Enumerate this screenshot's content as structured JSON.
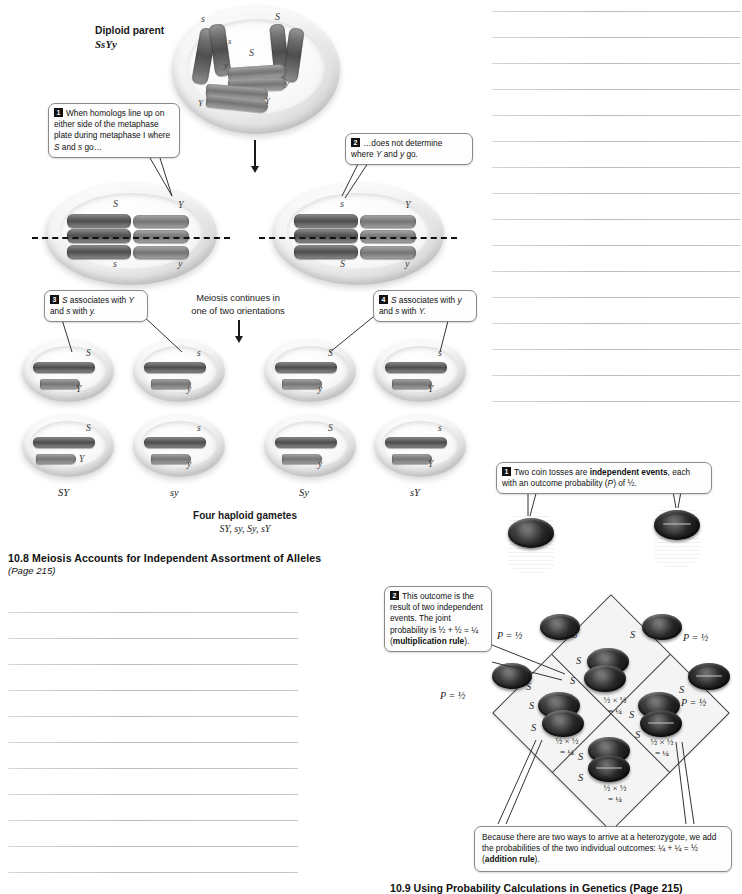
{
  "figure_top": {
    "parent_label_line1": "Diploid parent",
    "parent_label_line2": "SsYy",
    "callouts": [
      {
        "num": "1",
        "text": "When homologs line up on either side of the metaphase plate during metaphase I where S and s go…"
      },
      {
        "num": "2",
        "text": "…does not determine where Y and y go."
      },
      {
        "num": "3",
        "text": "S associates with Y and s with y."
      },
      {
        "num": "4",
        "text": "S associates with y and s with Y."
      }
    ],
    "middle_note_line1": "Meiosis continues in",
    "middle_note_line2": "one of two orientations",
    "metaphase_left": {
      "top_left": "S",
      "top_right": "Y",
      "bottom_left": "s",
      "bottom_right": "y"
    },
    "metaphase_right": {
      "top_left": "s",
      "top_right": "Y",
      "bottom_left": "S",
      "bottom_right": "y"
    },
    "parent_chromosome_labels": [
      "s",
      "S",
      "s",
      "S",
      "y",
      "y",
      "Y",
      "Y"
    ],
    "gamete_labels": [
      "SY",
      "sy",
      "Sy",
      "sY"
    ],
    "gamete_cell_labels": [
      {
        "top": "S",
        "bottom": "Y"
      },
      {
        "top": "s",
        "bottom": "y"
      },
      {
        "top": "S",
        "bottom": "y"
      },
      {
        "top": "s",
        "bottom": "Y"
      },
      {
        "top": "S",
        "bottom": "Y"
      },
      {
        "top": "s",
        "bottom": "y"
      },
      {
        "top": "S",
        "bottom": "y"
      },
      {
        "top": "s",
        "bottom": "Y"
      }
    ],
    "summary_line1": "Four haploid gametes",
    "summary_line2": "SY, sy, Sy, sY",
    "caption_title": "10.8  Meiosis Accounts for Independent Assortment of Alleles",
    "caption_page": "(Page 215)"
  },
  "figure_bottom": {
    "callouts": [
      {
        "num": "1",
        "line1_a": "Two coin tosses are ",
        "line1_b": "independent events",
        "line1_c": ",",
        "line2_a": "each with an outcome probability (",
        "line2_b": "P",
        "line2_c": ") of ½."
      },
      {
        "num": "2",
        "lines": [
          "This outcome is the",
          "result of two",
          "independent events.",
          "The joint probability",
          "is ½ + ½ = ¼"
        ],
        "bold_tail": "multiplication rule",
        "tail_open": "(",
        "tail_close": ")."
      },
      {
        "num": "",
        "lines": [
          "Because there are two ways to arrive at a",
          "heterozygote, we add the probabilities of the two",
          "individual outcomes: ¼ + ¼ = ½  "
        ],
        "bold_tail": "addition rule",
        "tail_open": "(",
        "tail_close": ")."
      }
    ],
    "probability_labels": [
      "P = ½",
      "P = ½",
      "P = ½",
      "P = ½"
    ],
    "allele_labels": [
      "S",
      "S",
      "S",
      "S",
      "S",
      "S",
      "S",
      "S"
    ],
    "cell_probabilities": [
      {
        "expr": "½  ×  ½",
        "result": "= ¼"
      },
      {
        "expr": "½  ×  ½",
        "result": "= ¼"
      },
      {
        "expr": "½  ×  ½",
        "result": "= ¼"
      },
      {
        "expr": "½  ×  ½",
        "result": "= ¼"
      }
    ],
    "caption_title": "10.9  Using Probability Calculations in Genetics   (Page 215)"
  },
  "notes": {
    "right_column_line_count": 16,
    "left_column_line_count": 12,
    "line_color": "#c9c9c9"
  }
}
